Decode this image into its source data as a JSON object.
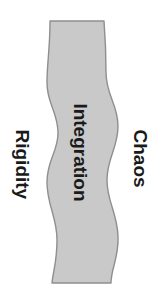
{
  "diagram": {
    "background_color": "#ffffff",
    "band": {
      "name": "integration-band",
      "label": "Integration",
      "fill_color": "#c9c9c9",
      "stroke_color": "#8f8f8f",
      "orientation": "vertical",
      "shape": "wavy-ribbon"
    },
    "left_label": {
      "name": "rigidity",
      "text": "Rigidity",
      "color": "#1a1a1a",
      "rotation_deg": 90
    },
    "right_label": {
      "name": "chaos",
      "text": "Chaos",
      "color": "#1a1a1a",
      "rotation_deg": 90
    },
    "center_label": {
      "name": "integration",
      "text": "Integration",
      "color": "#1a1a1a",
      "rotation_deg": 90
    },
    "watermark": {
      "text": "",
      "color": "#fcfcfc"
    }
  }
}
